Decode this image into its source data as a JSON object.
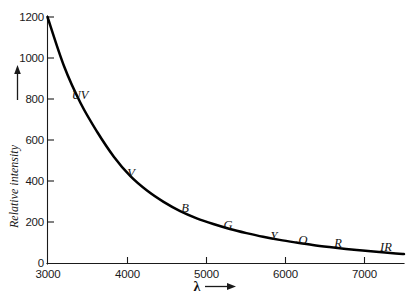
{
  "figure": {
    "name": "relative-intensity-vs-wavelength",
    "background_color": "#ffffff",
    "ink_color": "#111111"
  },
  "axes": {
    "y_title": "Relative intensity",
    "y_arrow": "up-arrow",
    "x_title": "λ",
    "x_arrow": "right-arrow"
  },
  "labels": {
    "uv": "UV",
    "v": "V",
    "b": "B",
    "g": "G",
    "y": "Y",
    "o": "O",
    "r": "R",
    "ir": "IR"
  },
  "chart_data": {
    "type": "line",
    "title": "",
    "subtitle": "",
    "xlabel": "λ",
    "ylabel": "Relative intensity",
    "xlim": [
      3000,
      7300
    ],
    "ylim": [
      0,
      1280
    ],
    "grid": false,
    "legend": null,
    "x_ticks": [
      3000,
      4000,
      5000,
      6000,
      7000
    ],
    "x_tick_labels": [
      "3000",
      "4000",
      "5000",
      "6000",
      "7000"
    ],
    "y_ticks": [
      0,
      200,
      400,
      600,
      800,
      1000,
      1200
    ],
    "y_tick_labels": [
      "0",
      "200",
      "400",
      "600",
      "800",
      "1000",
      "1200"
    ],
    "series": [
      {
        "name": "relative intensity",
        "x": [
          3000,
          3200,
          3400,
          3600,
          3800,
          4000,
          4200,
          4400,
          4600,
          4800,
          5000,
          5200,
          5400,
          5600,
          5800,
          6000,
          6200,
          6400,
          6600,
          6800,
          7000,
          7200,
          7300
        ],
        "values": [
          1200,
          960,
          780,
          640,
          520,
          425,
          355,
          300,
          255,
          220,
          192,
          168,
          148,
          130,
          115,
          102,
          90,
          80,
          71,
          63,
          56,
          49,
          46
        ]
      }
    ],
    "annotations": [
      {
        "text": "UV",
        "x": 3420,
        "y": 735
      },
      {
        "text": "V",
        "x": 4020,
        "y": 455
      },
      {
        "text": "B",
        "x": 4700,
        "y": 280
      },
      {
        "text": "G",
        "x": 5250,
        "y": 200
      },
      {
        "text": "Y",
        "x": 5830,
        "y": 148
      },
      {
        "text": "O",
        "x": 6190,
        "y": 128
      },
      {
        "text": "R",
        "x": 6620,
        "y": 112
      },
      {
        "text": "IR",
        "x": 7220,
        "y": 90
      }
    ]
  }
}
